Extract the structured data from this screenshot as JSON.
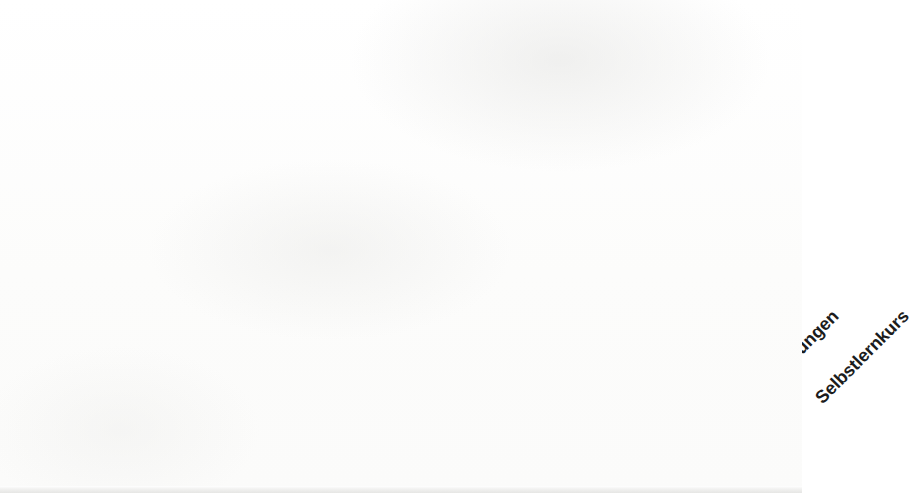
{
  "chart_data": {
    "type": "bar",
    "title": "",
    "subtitle": "",
    "xlabel": "",
    "ylabel": "",
    "ylim": [
      0,
      90
    ],
    "grid": false,
    "legend": false,
    "legend_position": "none",
    "orientation": "vertical",
    "decimal_separator": ",",
    "value_suffix": "%",
    "bar_color": "#a8a8a8",
    "label_color": "#1a1a1a",
    "axis_color": "#b3b3b3",
    "categories": [
      "Schulunterricht",
      "Sprachkurs",
      "Mitlernen mit den Kindern",
      "Kontakt zu Muttersprachlern",
      "Musik",
      "Zeitschriften/Bücher",
      "Filme/Sendungen",
      "Selbstlernkurs"
    ],
    "values": [
      80.9,
      23.8,
      23.4,
      16.0,
      11.1,
      6.1,
      4.8,
      2.8
    ],
    "data_labels": [
      "80,9%",
      "23,8%",
      "23,4%",
      "16,0%",
      "11,1%",
      "6,1%",
      "4,8%",
      "2,8%"
    ]
  },
  "bars": [
    {
      "category": "Schulunterricht",
      "value": 80.9,
      "label": "80,9%"
    },
    {
      "category": "Sprachkurs",
      "value": 23.8,
      "label": "23,8%"
    },
    {
      "category": "Mitlernen mit den Kindern",
      "value": 23.4,
      "label": "23,4%"
    },
    {
      "category": "Kontakt zu Muttersprachlern",
      "value": 16.0,
      "label": "16,0%"
    },
    {
      "category": "Musik",
      "value": 11.1,
      "label": "11,1%"
    },
    {
      "category": "Zeitschriften/Bücher",
      "value": 6.1,
      "label": "6,1%"
    },
    {
      "category": "Filme/Sendungen",
      "value": 4.8,
      "label": "4,8%"
    },
    {
      "category": "Selbstlernkurs",
      "value": 2.8,
      "label": "2,8%"
    }
  ]
}
